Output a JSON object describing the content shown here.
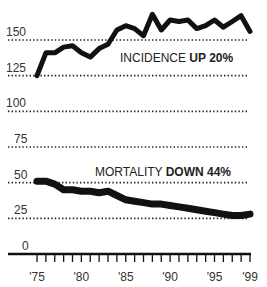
{
  "chart_data": {
    "type": "line",
    "title": "",
    "xlabel": "",
    "ylabel": "",
    "x": [
      1975,
      1976,
      1977,
      1978,
      1979,
      1980,
      1981,
      1982,
      1983,
      1984,
      1985,
      1986,
      1987,
      1988,
      1989,
      1990,
      1991,
      1992,
      1993,
      1994,
      1995,
      1996,
      1997,
      1998,
      1999
    ],
    "x_tick_labels": [
      "'75",
      "'80",
      "'85",
      "'90",
      "'95",
      "'99"
    ],
    "x_tick_values": [
      1975,
      1980,
      1985,
      1990,
      1995,
      1999
    ],
    "y_tick_labels": [
      "0",
      "25",
      "50",
      "75",
      "100",
      "125",
      "150"
    ],
    "y_tick_values": [
      0,
      25,
      50,
      75,
      100,
      125,
      150
    ],
    "ylim": [
      0,
      170
    ],
    "grid": "dotted horizontal",
    "legend": "none (inline annotations)",
    "series": [
      {
        "name": "Incidence",
        "annotation_prefix": "INCIDENCE ",
        "annotation_bold": "UP 20%",
        "values": [
          125,
          141,
          141,
          145,
          146,
          141,
          138,
          144,
          147,
          157,
          160,
          158,
          153,
          168,
          157,
          164,
          163,
          164,
          158,
          160,
          164,
          159,
          163,
          167,
          156
        ]
      },
      {
        "name": "Mortality",
        "annotation_prefix": "MORTALITY ",
        "annotation_bold": "DOWN 44%",
        "values": [
          51,
          51,
          49,
          45,
          45,
          44,
          44,
          43,
          44,
          41,
          38,
          37,
          36,
          35,
          35,
          34,
          33,
          32,
          31,
          30,
          29,
          28,
          27,
          27,
          28
        ]
      }
    ]
  },
  "colors": {
    "line": "#111111",
    "grid": "#222222",
    "text": "#333333",
    "background": "#ffffff"
  }
}
